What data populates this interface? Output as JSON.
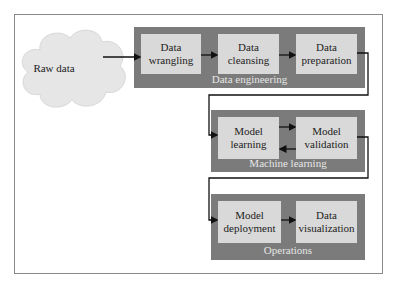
{
  "source": {
    "label": "Raw data"
  },
  "groups": [
    {
      "label": "Data engineering",
      "nodes": [
        {
          "label": "Data\nwrangling"
        },
        {
          "label": "Data\ncleansing"
        },
        {
          "label": "Data\npreparation"
        }
      ]
    },
    {
      "label": "Machine learning",
      "nodes": [
        {
          "label": "Model\nlearning"
        },
        {
          "label": "Model\nvalidation"
        }
      ]
    },
    {
      "label": "Operations",
      "nodes": [
        {
          "label": "Model\ndeployment"
        },
        {
          "label": "Data\nvisualization"
        }
      ]
    }
  ],
  "colors": {
    "group": "#7b7b7b",
    "node": "#d9d9d9",
    "cloud": "#e6e6e6",
    "line": "#111111"
  }
}
